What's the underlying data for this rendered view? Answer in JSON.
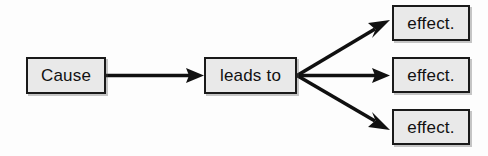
{
  "diagram": {
    "type": "flow",
    "background_color": "#fdfdfd",
    "node_fill_color": "#e9e9e9",
    "node_border_color": "#1a1a1a",
    "arrow_color": "#101010",
    "nodes": [
      {
        "id": "cause",
        "label": "Cause"
      },
      {
        "id": "leads_to",
        "label": "leads to"
      },
      {
        "id": "effect_1",
        "label": "effect."
      },
      {
        "id": "effect_2",
        "label": "effect."
      },
      {
        "id": "effect_3",
        "label": "effect."
      }
    ],
    "edges": [
      {
        "from": "cause",
        "to": "leads_to",
        "style": "solid-arrow"
      },
      {
        "from": "leads_to",
        "to": "effect_1",
        "style": "solid-arrow"
      },
      {
        "from": "leads_to",
        "to": "effect_2",
        "style": "solid-arrow"
      },
      {
        "from": "leads_to",
        "to": "effect_3",
        "style": "solid-arrow"
      }
    ],
    "background_ghost_text": {
      "note": "faint bleed-through from reverse of scanned page, illegible",
      "lines": [
        "",
        "",
        "",
        ""
      ]
    }
  }
}
